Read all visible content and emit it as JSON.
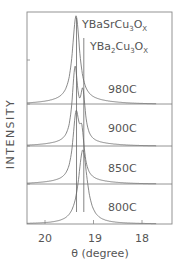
{
  "chart_data": {
    "type": "line",
    "title": "",
    "xlabel": "θ (degree)",
    "ylabel": "INTENSITY",
    "xlim": [
      20.5,
      17.6
    ],
    "x_reversed": true,
    "xticks": [
      20,
      19,
      18
    ],
    "xtick_labels": [
      "20",
      "19",
      "18"
    ],
    "grid": false,
    "stacked_offset": true,
    "reference_lines": [
      {
        "label": "YBaSrCu3Ox",
        "label_parts": {
          "a": "YBaSrCu",
          "s1": "3",
          "b": "O",
          "s2": "X"
        },
        "x": 19.35
      },
      {
        "label": "YBa2Cu3Ox",
        "label_parts": {
          "a": "YBa",
          "s1": "2",
          "b": "Cu",
          "s2": "3",
          "c": "O",
          "s3": "X"
        },
        "x": 19.2
      }
    ],
    "series": [
      {
        "name": "980C",
        "peak_x": 19.36,
        "peak_height": 0.95,
        "fwhm": 0.18,
        "background": 0.03
      },
      {
        "name": "900C",
        "peaks": [
          {
            "x": 19.38,
            "height": 0.9,
            "fwhm": 0.14
          },
          {
            "x": 19.22,
            "height": 0.55,
            "fwhm": 0.12
          }
        ],
        "background": 0.03
      },
      {
        "name": "850C",
        "peaks": [
          {
            "x": 19.36,
            "height": 0.85,
            "fwhm": 0.16
          },
          {
            "x": 19.24,
            "height": 0.5,
            "fwhm": 0.12
          }
        ],
        "background": 0.03
      },
      {
        "name": "800C",
        "peaks": [
          {
            "x": 19.22,
            "height": 0.95,
            "fwhm": 0.22
          }
        ],
        "background": 0.0
      }
    ],
    "legend_position": "top-right"
  },
  "labels": {
    "ylabel": "INTENSITY",
    "xlabel": "θ (degree)",
    "ref1": {
      "a": "YBaSrCu",
      "s1": "3",
      "b": "O",
      "s2": "X"
    },
    "ref2": {
      "a": "YBa",
      "s1": "2",
      "b": "Cu",
      "s2": "3",
      "c": "O",
      "s3": "X"
    },
    "temps": [
      "980C",
      "900C",
      "850C",
      "800C"
    ],
    "ticks": [
      "20",
      "19",
      "18"
    ]
  }
}
